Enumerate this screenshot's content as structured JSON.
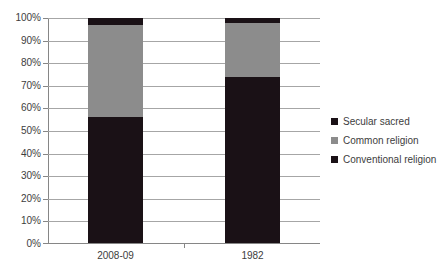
{
  "chart_data": {
    "type": "bar",
    "subtype": "100% stacked bar",
    "title": "",
    "subtitle": "",
    "xlabel": "",
    "ylabel": "",
    "categories": [
      "2008-09",
      "1982"
    ],
    "series": [
      {
        "name": "Conventional religion",
        "values": [
          56,
          74
        ],
        "color": "#1a1116"
      },
      {
        "name": "Common religion",
        "values": [
          41,
          24
        ],
        "color": "#8c8c8c"
      },
      {
        "name": "Secular sacred",
        "values": [
          3,
          2
        ],
        "color": "#1a1116"
      }
    ],
    "stack_order_bottom_to_top": [
      "Conventional religion",
      "Common religion",
      "Secular sacred"
    ],
    "ylim": [
      0,
      100
    ],
    "yticks": [
      0,
      10,
      20,
      30,
      40,
      50,
      60,
      70,
      80,
      90,
      100
    ],
    "ytick_labels": [
      "0%",
      "10%",
      "20%",
      "30%",
      "40%",
      "50%",
      "60%",
      "70%",
      "80%",
      "90%",
      "100%"
    ],
    "grid": true,
    "grid_axis": "y",
    "legend": true,
    "legend_position": "right",
    "legend_entries": [
      {
        "label": "Secular sacred",
        "color": "#1a1116"
      },
      {
        "label": "Common religion",
        "color": "#8c8c8c"
      },
      {
        "label": "Conventional religion",
        "color": "#1a1116"
      }
    ]
  },
  "axis": {
    "y_labels": [
      "100%",
      "90%",
      "80%",
      "70%",
      "60%",
      "50%",
      "40%",
      "30%",
      "20%",
      "10%",
      "0%"
    ],
    "x_labels": [
      "2008-09",
      "1982"
    ]
  },
  "colors": {
    "dark": "#1a1116",
    "gray": "#8c8c8c",
    "axis": "#868686",
    "grid": "#a6a6a6",
    "text": "#3d3d3d",
    "background": "#ffffff"
  }
}
